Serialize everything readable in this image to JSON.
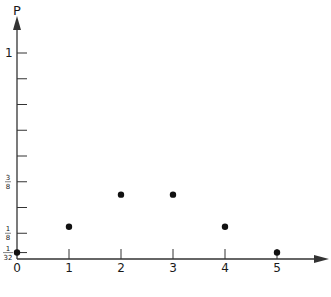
{
  "chart_data": {
    "type": "scatter",
    "title": "",
    "xlabel": "",
    "ylabel": "P",
    "x": [
      0,
      1,
      2,
      3,
      4,
      5
    ],
    "y": [
      0.03125,
      0.15625,
      0.3125,
      0.3125,
      0.15625,
      0.03125
    ],
    "x_ticks": [
      {
        "value": 0,
        "label": "0"
      },
      {
        "value": 1,
        "label": "1"
      },
      {
        "value": 2,
        "label": "2"
      },
      {
        "value": 3,
        "label": "3"
      },
      {
        "value": 4,
        "label": "4"
      },
      {
        "value": 5,
        "label": "5"
      }
    ],
    "y_ticks": [
      {
        "value": 0.03125,
        "num": "1",
        "den": "32"
      },
      {
        "value": 0.125,
        "num": "1",
        "den": "8"
      },
      {
        "value": 0.25
      },
      {
        "value": 0.375,
        "num": "3",
        "den": "8"
      },
      {
        "value": 0.5
      },
      {
        "value": 0.625
      },
      {
        "value": 0.75
      },
      {
        "value": 0.875
      },
      {
        "value": 1,
        "label": "1"
      }
    ],
    "xlim": [
      0,
      6
    ],
    "ylim": [
      0,
      1.2
    ],
    "grid": false,
    "legend": "none",
    "colors": {
      "axis": "#333333",
      "point": "#111111"
    }
  }
}
